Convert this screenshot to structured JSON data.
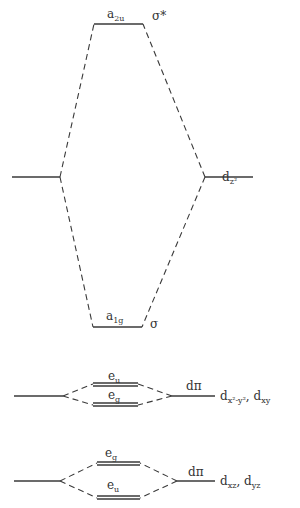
{
  "diagram": {
    "type": "mo_energy_level_diagram",
    "levels": {
      "sigma_star": {
        "label": "a",
        "sub": "2u",
        "symbol": "σ*"
      },
      "sigma": {
        "label": "a",
        "sub": "1g",
        "symbol": "σ"
      },
      "dz2": {
        "label": "d",
        "sub": "z²"
      },
      "pi_upper_eu": {
        "label": "e",
        "sub": "u"
      },
      "pi_upper_eg": {
        "label": "e",
        "sub": "g"
      },
      "pi_upper_d": {
        "label": "dπ",
        "orbital": "d",
        "orbital_sub": "x²-y²",
        "orbital2": "d",
        "orbital2_sub": "xy"
      },
      "pi_lower_eg": {
        "label": "e",
        "sub": "g"
      },
      "pi_lower_eu": {
        "label": "e",
        "sub": "u"
      },
      "pi_lower_d": {
        "label": "dπ",
        "orbital": "d",
        "orbital_sub": "xz",
        "orbital2": "d",
        "orbital2_sub": "yz"
      }
    }
  }
}
